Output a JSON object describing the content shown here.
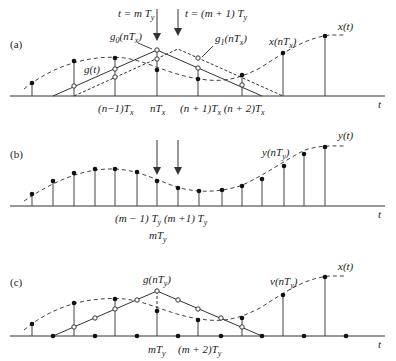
{
  "figure": {
    "panels": [
      {
        "id": "a",
        "label": "(a)",
        "arrows": [
          {
            "label": "t = m T_y",
            "text_main": "t = m T",
            "sub": "y"
          },
          {
            "label": "t = (m + 1) T_y",
            "text_main": "t = (m + 1) T",
            "sub": "y"
          }
        ],
        "annotations": {
          "g0": "g₀(nTₓ)",
          "g1": "g₁(nTₓ)",
          "gt": "g(t)",
          "xnt": "x(nTₓ)",
          "xt": "x(t)"
        },
        "ticks": [
          "(n−1)Tₓ",
          "nTₓ",
          "(n + 1)Tₓ",
          "(n + 2)Tₓ"
        ],
        "axis_label": "t"
      },
      {
        "id": "b",
        "label": "(b)",
        "annotations": {
          "ynt": "y(nTᵧ)",
          "yt": "y(t)"
        },
        "ticks": [
          "(m − 1) Tᵧ",
          "(m +1) Tᵧ",
          "mTᵧ"
        ],
        "axis_label": "t"
      },
      {
        "id": "c",
        "label": "(c)",
        "annotations": {
          "gnt": "g(nTᵧ)",
          "vnt": "v(nTᵧ)",
          "xt": "x(t)"
        },
        "ticks": [
          "mTᵧ",
          "(m + 2)Tᵧ"
        ],
        "axis_label": "t"
      }
    ]
  }
}
